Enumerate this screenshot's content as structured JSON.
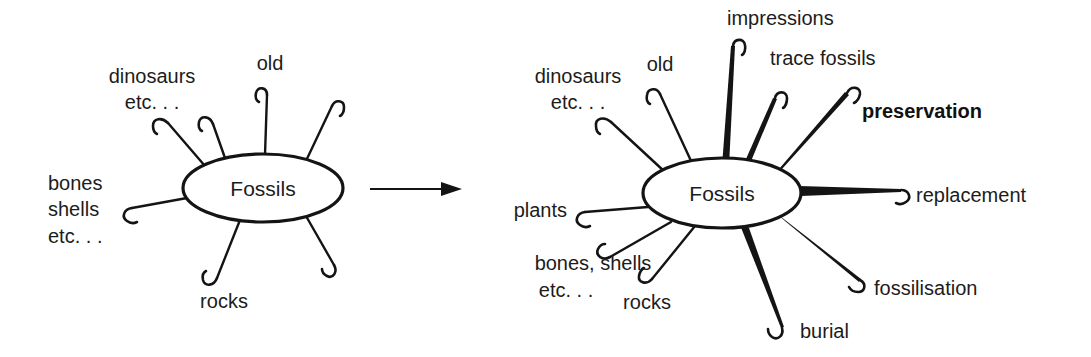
{
  "figure": {
    "type": "concept-map-pair",
    "background_color": "#ffffff",
    "ink_color": "#141414",
    "transition_arrow": {
      "name": "transition-arrow",
      "direction": "left-to-right",
      "from": "before-map",
      "to": "after-map"
    }
  },
  "before_map": {
    "center_label": "Fossils",
    "center": {
      "cx": 263,
      "cy": 188,
      "rx": 80,
      "ry": 34
    },
    "spokes": [
      {
        "id": "dinosaurs",
        "label": "dinosaurs\netc. . .",
        "label_lines": [
          "dinosaurs",
          "etc. . ."
        ],
        "weight": "thin",
        "angle_deg": 208,
        "hook": "left",
        "label_anchor": "middle",
        "label_x": 152,
        "label_y": 78,
        "tip_x": 168,
        "tip_y": 118
      },
      {
        "id": "unlabelled-upper-left",
        "label": "",
        "label_lines": [],
        "weight": "thin",
        "angle_deg": 250,
        "hook": "left",
        "label_anchor": "middle",
        "label_x": 0,
        "label_y": 0,
        "tip_x": 212,
        "tip_y": 122
      },
      {
        "id": "old",
        "label": "old",
        "label_lines": [
          "old"
        ],
        "weight": "thin",
        "angle_deg": 272,
        "hook": "left",
        "label_anchor": "middle",
        "label_x": 270,
        "label_y": 65,
        "tip_x": 268,
        "tip_y": 90
      },
      {
        "id": "unlabelled-upper-right",
        "label": "",
        "label_lines": [],
        "weight": "thin",
        "angle_deg": 305,
        "hook": "right",
        "label_anchor": "middle",
        "label_x": 0,
        "label_y": 0,
        "tip_x": 330,
        "tip_y": 100
      },
      {
        "id": "bones-shells",
        "label": "bones\nshells\netc. . .",
        "label_lines": [
          "bones",
          "shells",
          "etc. . ."
        ],
        "weight": "thin",
        "angle_deg": 172,
        "hook": "left",
        "label_anchor": "start",
        "label_x": 48,
        "label_y": 185,
        "tip_x": 128,
        "tip_y": 209
      },
      {
        "id": "rocks",
        "label": "rocks",
        "label_lines": [
          "rocks"
        ],
        "weight": "thin",
        "angle_deg": 108,
        "hook": "left",
        "label_anchor": "middle",
        "label_x": 224,
        "label_y": 303,
        "tip_x": 216,
        "tip_y": 280
      },
      {
        "id": "unlabelled-lower-right",
        "label": "",
        "label_lines": [],
        "weight": "thin",
        "angle_deg": 55,
        "hook": "right",
        "label_anchor": "middle",
        "label_x": 0,
        "label_y": 0,
        "tip_x": 333,
        "tip_y": 268
      }
    ]
  },
  "after_map": {
    "center_label": "Fossils",
    "center": {
      "cx": 722,
      "cy": 193,
      "rx": 79,
      "ry": 35
    },
    "spokes": [
      {
        "id": "dinosaurs",
        "label": "dinosaurs\netc. . .",
        "label_lines": [
          "dinosaurs",
          "etc. . ."
        ],
        "weight": "thin",
        "hook": "left",
        "label_anchor": "middle",
        "label_x": 578,
        "label_y": 78,
        "tip_x": 609,
        "tip_y": 120
      },
      {
        "id": "old",
        "label": "old",
        "label_lines": [
          "old"
        ],
        "weight": "thin",
        "hook": "left",
        "label_anchor": "middle",
        "label_x": 660,
        "label_y": 66,
        "tip_x": 657,
        "tip_y": 88
      },
      {
        "id": "impressions",
        "label": "impressions",
        "label_lines": [
          "impressions"
        ],
        "weight": "thick",
        "hook": "right",
        "label_anchor": "start",
        "label_x": 727,
        "label_y": 20,
        "tip_x": 733,
        "tip_y": 42
      },
      {
        "id": "trace-fossils",
        "label": "trace fossils",
        "label_lines": [
          "trace fossils"
        ],
        "weight": "thick",
        "hook": "right",
        "label_anchor": "start",
        "label_x": 770,
        "label_y": 60,
        "tip_x": 774,
        "tip_y": 96
      },
      {
        "id": "preservation",
        "label": "preservation",
        "label_lines": [
          "preservation"
        ],
        "weight": "thick",
        "emphasis": "bold",
        "hook": "right",
        "label_anchor": "start",
        "label_x": 860,
        "label_y": 113,
        "tip_x": 846,
        "tip_y": 90
      },
      {
        "id": "replacement",
        "label": "replacement",
        "label_lines": [
          "replacement"
        ],
        "weight": "thick",
        "hook": "right",
        "label_anchor": "start",
        "label_x": 914,
        "label_y": 197,
        "tip_x": 900,
        "tip_y": 189
      },
      {
        "id": "fossilisation",
        "label": "fossilisation",
        "label_lines": [
          "fossilisation"
        ],
        "weight": "thick",
        "hook": "right",
        "label_anchor": "start",
        "label_x": 872,
        "label_y": 290,
        "tip_x": 858,
        "tip_y": 283
      },
      {
        "id": "burial",
        "label": "burial",
        "label_lines": [
          "burial"
        ],
        "weight": "thick",
        "hook": "right",
        "label_anchor": "start",
        "label_x": 800,
        "label_y": 333,
        "tip_x": 781,
        "tip_y": 329
      },
      {
        "id": "rocks",
        "label": "rocks",
        "label_lines": [
          "rocks"
        ],
        "weight": "thin",
        "hook": "left",
        "label_anchor": "middle",
        "label_x": 647,
        "label_y": 304,
        "tip_x": 650,
        "tip_y": 281
      },
      {
        "id": "bones-shells",
        "label": "bones, shells\netc. . .",
        "label_lines": [
          "bones, shells",
          "etc. . ."
        ],
        "weight": "thin",
        "hook": "left",
        "label_anchor": "middle",
        "label_x": 530,
        "label_y": 265,
        "tip_x": 605,
        "tip_y": 256
      },
      {
        "id": "plants",
        "label": "plants",
        "label_lines": [
          "plants"
        ],
        "weight": "thin",
        "hook": "left",
        "label_anchor": "end",
        "label_x": 567,
        "label_y": 212,
        "tip_x": 581,
        "tip_y": 211
      }
    ]
  }
}
